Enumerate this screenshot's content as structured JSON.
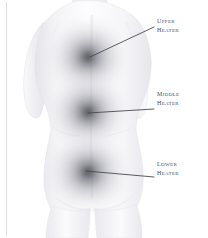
{
  "figure": {
    "background_color": "#ffffff",
    "body_fill_light": "#fbfbfc",
    "body_fill_shadow": "#e6e6ea",
    "body_outline_color": "#e2e2e6",
    "left_rule_color": "#dcdce0",
    "leader_line_color": "#4a4a50",
    "label_text_color": "#4a4a50",
    "heat_center_color": "#58585e",
    "heat_mid_color": "#9a9aa0",
    "heat_edge_color": "#ffffff"
  },
  "callouts": [
    {
      "id": "upper-heater",
      "line1": "Upper",
      "line2": "Heater",
      "zone_center_x": 88,
      "zone_center_y": 57,
      "zone_radius": 46,
      "leader_from_x": 90,
      "leader_from_y": 57,
      "leader_to_x": 154,
      "leader_to_y": 27
    },
    {
      "id": "middle-heater",
      "line1": "Middle",
      "line2": "Heater",
      "zone_center_x": 88,
      "zone_center_y": 112,
      "zone_radius": 46,
      "leader_from_x": 88,
      "leader_from_y": 113,
      "leader_to_x": 154,
      "leader_to_y": 109
    },
    {
      "id": "lower-heater",
      "line1": "Lower",
      "line2": "Heater",
      "zone_center_x": 88,
      "zone_center_y": 172,
      "zone_radius": 47,
      "leader_from_x": 86,
      "leader_from_y": 171,
      "leader_to_x": 154,
      "leader_to_y": 177
    }
  ]
}
